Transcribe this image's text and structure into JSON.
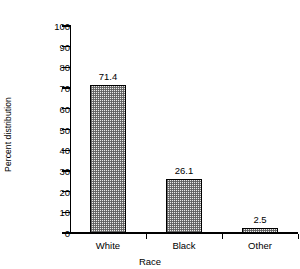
{
  "chart_data": {
    "type": "bar",
    "title": "",
    "subtitle": "",
    "categories": [
      "White",
      "Black",
      "Other"
    ],
    "values": [
      71.4,
      26.1,
      2.5
    ],
    "value_labels": [
      "71.4",
      "26.1",
      "2.5"
    ],
    "xlabel": "Race",
    "ylabel": "Percent distribution",
    "ylim": [
      0,
      100
    ],
    "ytick_labels": [
      "0",
      "10",
      "20",
      "30",
      "40",
      "50",
      "60",
      "70",
      "80",
      "90",
      "100"
    ],
    "ytick_values": [
      0,
      10,
      20,
      30,
      40,
      50,
      60,
      70,
      80,
      90,
      100
    ],
    "grid": false,
    "legend": null,
    "series": [
      {
        "name": "Percent distribution",
        "values": [
          71.4,
          26.1,
          2.5
        ]
      }
    ],
    "colors": {
      "bar_fill": "#ececeb",
      "bar_pattern": "#5a5a5a",
      "bar_border": "#000000",
      "axis": "#000000",
      "text": "#000000",
      "background": "#ffffff"
    }
  }
}
